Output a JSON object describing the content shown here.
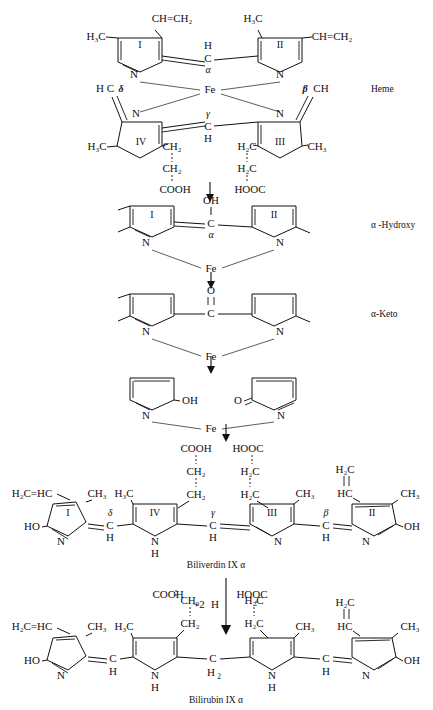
{
  "diagram": {
    "title_sequence": [
      "Heme",
      "α -Hydroxy",
      "α-Keto",
      "Biliverdin IX α",
      "Bilirubin IX α"
    ],
    "stage_labels": {
      "heme": "Heme",
      "alpha_hydroxy": "α -Hydroxy",
      "alpha_keto": "α-Keto"
    },
    "captions": {
      "biliverdin": "Biliverdin IX α",
      "bilirubin": "Bilirubin IX α"
    },
    "reduction_label": {
      "plus": "+2",
      "h": "H"
    },
    "atoms": {
      "fe": "Fe",
      "n": "N",
      "c": "C",
      "h": "H",
      "o": "O",
      "oh": "OH",
      "ho": "HO",
      "ch3": "CH",
      "ch3_sub": "3",
      "h3c": "H",
      "h3c_sub": "3",
      "h3c_rest": "C",
      "ch2": "CH",
      "ch2_sub": "2",
      "h2c": "H",
      "h2c_sub": "2",
      "h2c_rest": "C",
      "cooh": "COOH",
      "hooc": "HOOC",
      "hc": "HC",
      "ch": "CH"
    },
    "greek": {
      "alpha": "α",
      "beta": "β",
      "gamma": "γ",
      "delta": "δ"
    },
    "ring_numerals": {
      "one": "I",
      "two": "II",
      "three": "III",
      "four": "IV"
    },
    "heme": {
      "ring_I": {
        "numeral": "I",
        "substituent_left": "H₃C",
        "substituent_top": "CH=CH₂"
      },
      "ring_II": {
        "numeral": "II",
        "substituent_top": "H₃C",
        "substituent_right": "CH=CH₂"
      },
      "ring_III": {
        "numeral": "III",
        "substituent_right": "CH₃",
        "chain": [
          "H₂C",
          "H₂C",
          "HOOC"
        ]
      },
      "ring_IV": {
        "numeral": "IV",
        "substituent_left": "H₃C",
        "chain": [
          "CH₂",
          "CH₂",
          "COOH"
        ]
      },
      "bridges": {
        "alpha": "α",
        "beta": "β",
        "gamma": "γ",
        "delta": "δ"
      },
      "metal": "Fe",
      "delta_group": "H C",
      "beta_group": "CH"
    },
    "alpha_hydroxy": {
      "label": "α -Hydroxy",
      "bridge_group": "OH",
      "bridge_carbon": "C",
      "bridge_greek": "α",
      "metal": "Fe",
      "rings": [
        "I",
        "II"
      ]
    },
    "alpha_keto": {
      "label": "α-Keto",
      "bridge_group": "O",
      "bridge_carbon": "C",
      "metal": "Fe"
    },
    "open_complex": {
      "left_group": "OH",
      "right_group": "O",
      "metal": "Fe"
    },
    "biliverdin": {
      "caption": "Biliverdin IX α",
      "left_terminal": "H₂C=HC",
      "left_hydroxy": "HO",
      "right_hydroxy": "OH",
      "ring_order": [
        "I",
        "IV",
        "III",
        "II"
      ],
      "bridge_order": [
        "δ",
        "γ",
        "β"
      ],
      "methyls": [
        "CH₃",
        "H₃C",
        "CH₃",
        "CH₃"
      ],
      "propionate_left": [
        "COOH",
        "CH₂",
        "CH₂"
      ],
      "propionate_right": [
        "HOOC",
        "H₂C",
        "H₂C"
      ],
      "vinyl_right": [
        "H₂C",
        "HC"
      ],
      "nh": [
        "N",
        "H"
      ]
    },
    "bilirubin": {
      "caption": "Bilirubin IX α",
      "left_terminal": "H₂C=HC",
      "left_hydroxy": "HO",
      "right_hydroxy": "OH",
      "central_bridge": {
        "atom": "C",
        "subscript": "2"
      },
      "methyls": [
        "CH₃",
        "H₃C",
        "CH₃",
        "CH₃"
      ],
      "propionate_left": [
        "COOH",
        "CH₂",
        "CH₂"
      ],
      "propionate_right": [
        "HOOC",
        "H₂C",
        "H₂C"
      ],
      "vinyl_right": [
        "H₂C",
        "HC"
      ],
      "nh": [
        "N",
        "H"
      ]
    }
  }
}
